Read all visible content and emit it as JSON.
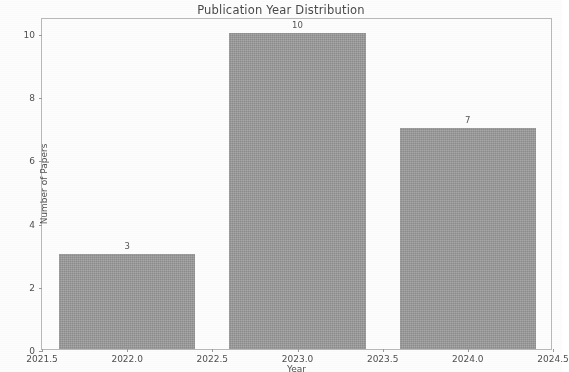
{
  "chart_data": {
    "type": "bar",
    "title": "Publication Year Distribution",
    "xlabel": "Year",
    "ylabel": "Number of Papers",
    "categories": [
      2022,
      2023,
      2024
    ],
    "values": [
      3,
      10,
      7
    ],
    "bar_labels": [
      "3",
      "10",
      "7"
    ],
    "bar_width": 0.8,
    "bar_color": "#9c9c9c",
    "xlim": [
      2021.5,
      2024.5
    ],
    "ylim": [
      0,
      10.5
    ],
    "xticks": [
      2021.5,
      2022.0,
      2022.5,
      2023.0,
      2023.5,
      2024.0,
      2024.5
    ],
    "xticklabels": [
      "2021.5",
      "2022.0",
      "2022.5",
      "2023.0",
      "2023.5",
      "2024.0",
      "2024.5"
    ],
    "yticks": [
      0,
      2,
      4,
      6,
      8,
      10
    ],
    "yticklabels": [
      "0",
      "2",
      "4",
      "6",
      "8",
      "10"
    ],
    "grid": false,
    "legend": null
  },
  "figure": {
    "background_color": "#fdfdfd",
    "frame_color": "#b9b9b9",
    "text_color": "#4f4f4f"
  }
}
